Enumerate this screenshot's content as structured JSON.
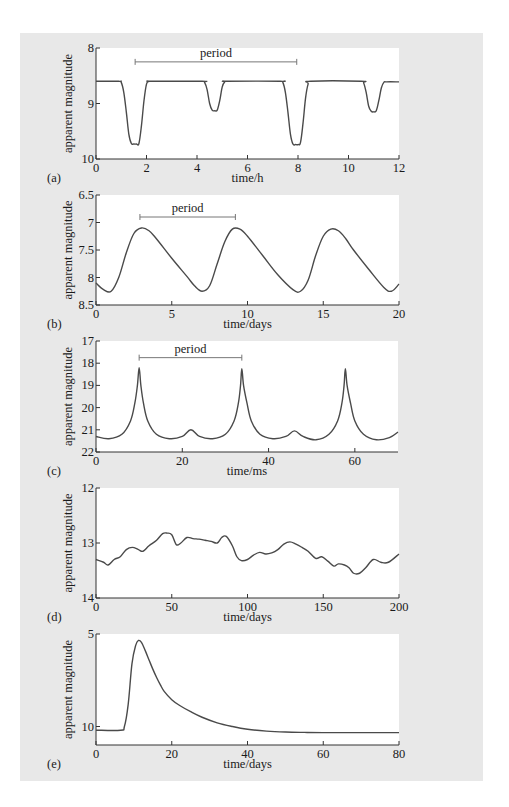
{
  "figure": {
    "background": "#e8e8e8",
    "plot_background": "#ffffff",
    "line_color": "#4a4a4a",
    "axis_color": "#333333"
  },
  "chart_data": [
    {
      "id": "a",
      "panel_label": "(a)",
      "type": "line",
      "title": "",
      "xlabel": "time/h",
      "ylabel": "apparent magnitude",
      "xlim": [
        0,
        12
      ],
      "ylim": [
        8,
        10
      ],
      "y_inverted": true,
      "xticks": [
        0,
        2,
        4,
        6,
        8,
        10,
        12
      ],
      "yticks": [
        8,
        9,
        10
      ],
      "grid": false,
      "annotations": [
        {
          "text": "period",
          "type": "bracket",
          "x_start": 1.55,
          "x_end": 7.95,
          "y": 8.25
        }
      ],
      "box": {
        "left": 96,
        "top": 48,
        "right": 399,
        "bottom": 159
      },
      "x": [
        0,
        0.9,
        1.0,
        1.1,
        1.2,
        1.3,
        1.4,
        1.5,
        1.6,
        1.7,
        1.8,
        1.9,
        2.0,
        2.1,
        2.2,
        4.2,
        4.3,
        4.4,
        4.5,
        4.6,
        4.7,
        4.8,
        4.9,
        5.0,
        5.1,
        5.2,
        7.3,
        7.4,
        7.5,
        7.6,
        7.7,
        7.8,
        7.9,
        8.0,
        8.1,
        8.2,
        8.3,
        8.4,
        8.5,
        10.5,
        10.6,
        10.7,
        10.8,
        10.9,
        11.0,
        11.1,
        11.2,
        11.3,
        11.4,
        11.5,
        12.0
      ],
      "values": [
        8.6,
        8.6,
        8.62,
        8.8,
        9.15,
        9.55,
        9.72,
        9.73,
        9.73,
        9.72,
        9.4,
        8.95,
        8.65,
        8.6,
        8.6,
        8.6,
        8.62,
        8.75,
        9.0,
        9.12,
        9.13,
        9.12,
        8.95,
        8.7,
        8.61,
        8.6,
        8.6,
        8.62,
        8.8,
        9.15,
        9.55,
        9.73,
        9.74,
        9.74,
        9.7,
        9.35,
        8.9,
        8.65,
        8.6,
        8.6,
        8.63,
        8.8,
        9.05,
        9.14,
        9.15,
        9.13,
        8.95,
        8.72,
        8.62,
        8.61,
        8.61
      ]
    },
    {
      "id": "b",
      "panel_label": "(b)",
      "type": "line",
      "title": "",
      "xlabel": "time/days",
      "ylabel": "apparent magnitude",
      "xlim": [
        0,
        20
      ],
      "ylim": [
        6.5,
        8.5
      ],
      "y_inverted": true,
      "xticks": [
        0,
        5,
        10,
        15,
        20
      ],
      "yticks": [
        6.5,
        7,
        7.5,
        8,
        8.5
      ],
      "grid": false,
      "annotations": [
        {
          "text": "period",
          "type": "bracket",
          "x_start": 2.9,
          "x_end": 9.2,
          "y": 6.9
        }
      ],
      "box": {
        "left": 96,
        "top": 195,
        "right": 399,
        "bottom": 305
      },
      "x": [
        0,
        0.5,
        1.0,
        1.5,
        2.0,
        2.5,
        3.0,
        3.5,
        4.0,
        5.0,
        6.0,
        6.5,
        7.0,
        7.5,
        8.0,
        8.5,
        9.0,
        9.5,
        10.0,
        11.0,
        12.0,
        13.0,
        13.5,
        14.0,
        14.5,
        15.0,
        15.5,
        16.0,
        16.5,
        17.0,
        18.0,
        19.0,
        19.5,
        20.0
      ],
      "values": [
        8.1,
        8.22,
        8.25,
        8.0,
        7.55,
        7.2,
        7.1,
        7.15,
        7.3,
        7.65,
        7.98,
        8.15,
        8.25,
        8.15,
        7.75,
        7.35,
        7.12,
        7.12,
        7.25,
        7.6,
        7.95,
        8.22,
        8.25,
        8.05,
        7.6,
        7.25,
        7.12,
        7.15,
        7.3,
        7.5,
        7.85,
        8.18,
        8.25,
        8.12
      ]
    },
    {
      "id": "c",
      "panel_label": "(c)",
      "type": "line",
      "title": "",
      "xlabel": "time/ms",
      "ylabel": "apparent magnitude",
      "xlim": [
        0,
        70
      ],
      "ylim": [
        17,
        22
      ],
      "y_inverted": true,
      "xticks": [
        0,
        20,
        40,
        60
      ],
      "yticks": [
        17,
        18,
        19,
        20,
        21,
        22
      ],
      "grid": false,
      "annotations": [
        {
          "text": "period",
          "type": "bracket",
          "x_start": 10,
          "x_end": 33.8,
          "y": 17.75
        }
      ],
      "box": {
        "left": 96,
        "top": 341,
        "right": 398,
        "bottom": 452
      },
      "x": [
        0,
        3,
        6,
        8,
        9,
        9.6,
        10,
        10.4,
        11,
        12,
        14,
        17,
        20,
        22,
        24,
        27,
        30,
        32,
        33,
        33.5,
        33.8,
        34.2,
        35,
        36,
        38,
        41,
        44,
        46,
        48,
        51,
        54,
        56,
        57,
        57.5,
        57.8,
        58.2,
        59,
        60,
        62,
        65,
        68,
        70
      ],
      "values": [
        21.3,
        21.4,
        21.2,
        20.6,
        19.8,
        19.0,
        18.2,
        19.0,
        19.8,
        20.6,
        21.2,
        21.4,
        21.3,
        21.0,
        21.3,
        21.4,
        21.2,
        20.6,
        19.8,
        19.0,
        18.25,
        19.0,
        19.8,
        20.6,
        21.2,
        21.4,
        21.3,
        21.05,
        21.3,
        21.45,
        21.2,
        20.6,
        19.8,
        19.0,
        18.25,
        19.0,
        19.8,
        20.6,
        21.2,
        21.45,
        21.35,
        21.1
      ]
    },
    {
      "id": "d",
      "panel_label": "(d)",
      "type": "line",
      "title": "",
      "xlabel": "time/days",
      "ylabel": "apparent magnitude",
      "xlim": [
        0,
        200
      ],
      "ylim": [
        12,
        14
      ],
      "y_inverted": true,
      "xticks": [
        0,
        50,
        100,
        150,
        200
      ],
      "yticks": [
        12,
        13,
        14
      ],
      "grid": false,
      "annotations": [],
      "box": {
        "left": 96,
        "top": 488,
        "right": 399,
        "bottom": 598
      },
      "x": [
        0,
        5,
        8,
        12,
        16,
        20,
        24,
        28,
        31,
        35,
        40,
        44,
        47,
        50,
        53,
        56,
        60,
        64,
        68,
        72,
        76,
        80,
        83,
        86,
        90,
        93,
        96,
        100,
        104,
        108,
        112,
        116,
        120,
        124,
        128,
        132,
        136,
        140,
        145,
        149,
        153,
        157,
        160,
        164,
        167,
        170,
        174,
        178,
        183,
        188,
        193,
        200
      ],
      "values": [
        13.3,
        13.35,
        13.4,
        13.3,
        13.25,
        13.12,
        13.08,
        13.12,
        13.15,
        13.05,
        12.95,
        12.83,
        12.82,
        12.85,
        13.03,
        13.0,
        12.9,
        12.92,
        12.93,
        12.95,
        12.97,
        13.0,
        12.9,
        12.88,
        13.05,
        13.25,
        13.32,
        13.3,
        13.22,
        13.17,
        13.2,
        13.18,
        13.12,
        13.02,
        12.98,
        13.02,
        13.08,
        13.15,
        13.28,
        13.25,
        13.33,
        13.42,
        13.38,
        13.4,
        13.45,
        13.55,
        13.55,
        13.45,
        13.3,
        13.35,
        13.35,
        13.2
      ]
    },
    {
      "id": "e",
      "panel_label": "(e)",
      "type": "line",
      "title": "",
      "xlabel": "time/days",
      "ylabel": "apparent magnitude",
      "xlim": [
        0,
        80
      ],
      "ylim": [
        5,
        11
      ],
      "y_inverted": true,
      "xticks": [
        0,
        20,
        40,
        60,
        80
      ],
      "yticks": [
        5,
        10
      ],
      "grid": false,
      "annotations": [],
      "box": {
        "left": 96,
        "top": 634,
        "right": 399,
        "bottom": 745
      },
      "x": [
        0,
        6.5,
        7.5,
        8.5,
        9.5,
        10.5,
        11.2,
        12,
        13,
        14,
        15,
        16,
        17,
        18,
        20,
        22,
        25,
        28,
        32,
        36,
        40,
        45,
        50,
        55,
        60,
        70,
        80
      ],
      "values": [
        10.2,
        10.2,
        10.0,
        8.8,
        6.6,
        5.6,
        5.35,
        5.45,
        5.9,
        6.4,
        6.9,
        7.35,
        7.75,
        8.1,
        8.55,
        8.85,
        9.2,
        9.5,
        9.8,
        10.0,
        10.15,
        10.25,
        10.3,
        10.32,
        10.33,
        10.33,
        10.33
      ]
    }
  ]
}
